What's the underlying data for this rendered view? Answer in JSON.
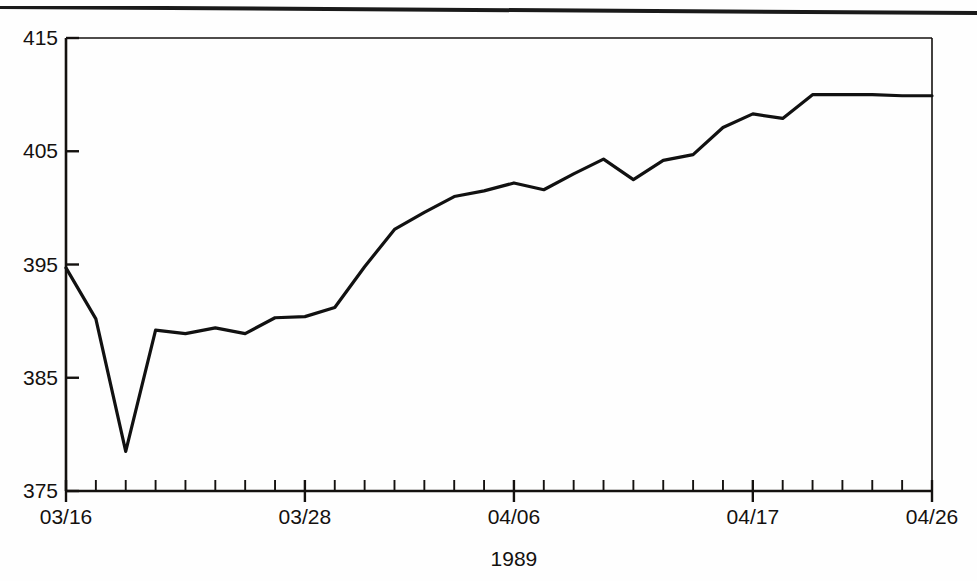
{
  "chart_data": {
    "type": "line",
    "title": "",
    "subtitle": "",
    "xlabel": "1989",
    "ylabel": "",
    "ylim": [
      375,
      415
    ],
    "xlim": [
      0,
      29
    ],
    "grid": false,
    "legend": null,
    "y_ticks": [
      375,
      385,
      395,
      405,
      415
    ],
    "y_tick_labels": [
      "375",
      "385",
      "395",
      "405",
      "415"
    ],
    "x_tick_labels": [
      "03/16",
      "03/28",
      "04/06",
      "04/17",
      "04/26"
    ],
    "x_tick_indices": [
      0,
      8,
      15,
      23,
      29
    ],
    "x_minor_tick_count": 30,
    "x": [
      "03/16",
      "03/17",
      "03/20",
      "03/21",
      "03/22",
      "03/23",
      "03/24",
      "03/27",
      "03/28",
      "03/29",
      "03/30",
      "03/31",
      "04/03",
      "04/04",
      "04/05",
      "04/06",
      "04/07",
      "04/10",
      "04/11",
      "04/12",
      "04/13",
      "04/14",
      "04/17",
      "04/18",
      "04/19",
      "04/20",
      "04/21",
      "04/24",
      "04/25",
      "04/26"
    ],
    "values": [
      394.7,
      390.2,
      378.5,
      389.2,
      388.9,
      389.4,
      388.9,
      390.3,
      390.4,
      391.2,
      394.8,
      398.1,
      399.6,
      401.0,
      401.5,
      402.2,
      401.6,
      403.0,
      404.3,
      402.5,
      404.2,
      404.7,
      407.1,
      408.3,
      407.9,
      410.0,
      410.0,
      410.0,
      409.9,
      409.9
    ],
    "series_name": "index",
    "line_color": "#111111",
    "line_width": 3.2,
    "axis_color": "#14110f",
    "background": "#ffffff"
  },
  "figure": {
    "page_rule_present": true,
    "frame": "left-and-bottom-axis with top-and-right border"
  }
}
